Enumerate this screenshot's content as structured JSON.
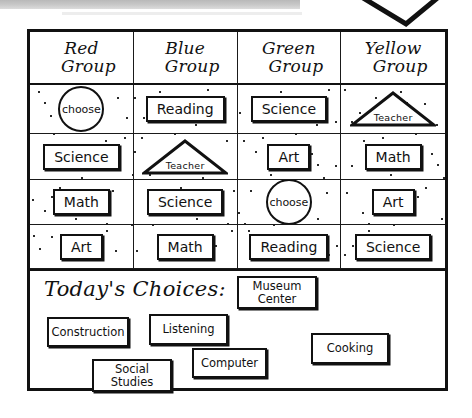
{
  "chart_data": {
    "type": "table",
    "columns": [
      "Red Group",
      "Blue Group",
      "Green Group",
      "Yellow Group"
    ],
    "rows": [
      [
        "choose",
        "Reading",
        "Science",
        "Teacher"
      ],
      [
        "Science",
        "Teacher",
        "Art",
        "Math"
      ],
      [
        "Math",
        "Science",
        "choose",
        "Art"
      ],
      [
        "Art",
        "Math",
        "Reading",
        "Science"
      ]
    ],
    "shape_legend": {
      "circle": "choose",
      "triangle": "Teacher",
      "rectangle": "subject"
    }
  },
  "header": {
    "columns": [
      {
        "line1": "Red",
        "line2": "Group"
      },
      {
        "line1": "Blue",
        "line2": "Group"
      },
      {
        "line1": "Green",
        "line2": "Group"
      },
      {
        "line1": "Yellow",
        "line2": "Group"
      }
    ]
  },
  "grid": {
    "rows": [
      [
        {
          "shape": "circle",
          "label": "choose"
        },
        {
          "shape": "rect",
          "label": "Reading"
        },
        {
          "shape": "rect",
          "label": "Science"
        },
        {
          "shape": "triangle",
          "label": "Teacher"
        }
      ],
      [
        {
          "shape": "rect",
          "label": "Science"
        },
        {
          "shape": "triangle",
          "label": "Teacher"
        },
        {
          "shape": "rect",
          "label": "Art"
        },
        {
          "shape": "rect",
          "label": "Math"
        }
      ],
      [
        {
          "shape": "rect",
          "label": "Math"
        },
        {
          "shape": "rect",
          "label": "Science"
        },
        {
          "shape": "circle",
          "label": "choose"
        },
        {
          "shape": "rect",
          "label": "Art"
        }
      ],
      [
        {
          "shape": "rect",
          "label": "Art"
        },
        {
          "shape": "rect",
          "label": "Math"
        },
        {
          "shape": "rect",
          "label": "Reading"
        },
        {
          "shape": "rect",
          "label": "Science"
        }
      ]
    ]
  },
  "choices": {
    "title": "Today's Choices:",
    "items": [
      {
        "label": "Construction",
        "x": 17,
        "y": 46,
        "w": 82,
        "h": 30
      },
      {
        "label": "Listening",
        "x": 119,
        "y": 43,
        "w": 79,
        "h": 31
      },
      {
        "label": "Museum\nCenter",
        "x": 207,
        "y": 5,
        "w": 80,
        "h": 33
      },
      {
        "label": "Social\nStudies",
        "x": 62,
        "y": 88,
        "w": 80,
        "h": 33
      },
      {
        "label": "Computer",
        "x": 162,
        "y": 77,
        "w": 75,
        "h": 30
      },
      {
        "label": "Cooking",
        "x": 281,
        "y": 62,
        "w": 78,
        "h": 31
      }
    ]
  }
}
